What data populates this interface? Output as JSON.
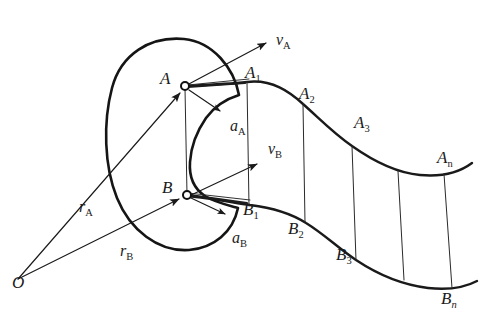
{
  "figure": {
    "background_color": "#ffffff",
    "line_color": "#1a1a1a",
    "origin": {
      "label": "O",
      "x": 18,
      "y": 279
    },
    "points": [
      {
        "id": "A",
        "label": "A",
        "x": 184,
        "y": 86,
        "label_x": 160,
        "label_y": 84,
        "marker": "open-circle"
      },
      {
        "id": "B",
        "label": "B",
        "x": 186,
        "y": 195,
        "label_x": 162,
        "label_y": 193,
        "marker": "open-circle"
      }
    ],
    "upper_track_labels": [
      {
        "id": "A1",
        "base": "A",
        "subscript": "1",
        "x": 247,
        "y": 82,
        "label_x": 245,
        "label_y": 78
      },
      {
        "id": "A2",
        "base": "A",
        "subscript": "2",
        "x": 302,
        "y": 103,
        "label_x": 299,
        "label_y": 99
      },
      {
        "id": "A3",
        "base": "A",
        "subscript": "3",
        "x": 358,
        "y": 132,
        "label_x": 354,
        "label_y": 128
      },
      {
        "id": "An",
        "base": "A",
        "subscript": "n",
        "x": 444,
        "y": 167,
        "label_x": 437,
        "label_y": 163
      }
    ],
    "lower_track_labels": [
      {
        "id": "B1",
        "base": "B",
        "subscript": "1",
        "x": 249,
        "y": 205,
        "label_x": 243,
        "label_y": 213
      },
      {
        "id": "B2",
        "base": "B",
        "subscript": "2",
        "x": 300,
        "y": 218,
        "label_x": 289,
        "label_y": 233
      },
      {
        "id": "B3",
        "base": "B",
        "subscript": "3",
        "x": 350,
        "y": 243,
        "label_x": 337,
        "label_y": 259
      },
      {
        "id": "Bn",
        "base": "B",
        "subscript": "n",
        "x": 455,
        "y": 288,
        "label_x": 443,
        "label_y": 303
      }
    ],
    "vectors": [
      {
        "id": "rA",
        "base": "r",
        "subscript": "A",
        "kind": "position",
        "label_x": 79,
        "label_y": 208,
        "from_x": 18,
        "from_y": 279,
        "to_x": 182,
        "to_y": 92
      },
      {
        "id": "rB",
        "base": "r",
        "subscript": "B",
        "kind": "position",
        "label_x": 122,
        "label_y": 253,
        "from_x": 18,
        "from_y": 279,
        "to_x": 181,
        "to_y": 199
      },
      {
        "id": "vA",
        "base": "v",
        "subscript": "A",
        "kind": "velocity",
        "label_x": 277,
        "label_y": 40,
        "from_x": 186,
        "from_y": 86,
        "to_x": 268,
        "to_y": 42
      },
      {
        "id": "vB",
        "base": "v",
        "subscript": "B",
        "kind": "velocity",
        "label_x": 270,
        "label_y": 151,
        "from_x": 188,
        "from_y": 196,
        "to_x": 259,
        "to_y": 163
      },
      {
        "id": "aA",
        "base": "a",
        "subscript": "A",
        "kind": "acceleration",
        "label_x": 233,
        "label_y": 128,
        "from_x": 188,
        "from_y": 89,
        "to_x": 222,
        "to_y": 112
      },
      {
        "id": "aB",
        "base": "a",
        "subscript": "B",
        "kind": "acceleration",
        "label_x": 235,
        "label_y": 240,
        "from_x": 190,
        "from_y": 198,
        "to_x": 227,
        "to_y": 215
      }
    ],
    "connector_count": 6,
    "arrowhead_color": "#1a1a1a"
  }
}
